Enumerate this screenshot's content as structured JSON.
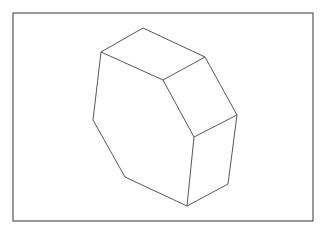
{
  "figure": {
    "frame": {
      "x": 13,
      "y": 13,
      "width": 300,
      "height": 208,
      "stroke": "#555555"
    },
    "stroke_color": "#444444",
    "shape": "octagonal-prism"
  }
}
